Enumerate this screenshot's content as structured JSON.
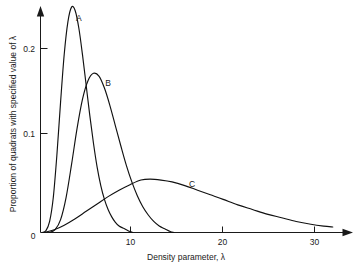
{
  "chart_data": {
    "type": "line",
    "title": "",
    "subtitle": "",
    "xlabel": "Density parameter, λ",
    "ylabel": "Proportion of quadrats with specified value of λ",
    "xlim": [
      0,
      34
    ],
    "ylim": [
      0,
      0.255
    ],
    "grid": false,
    "legend_position": "inline-curve-labels",
    "xticks": [
      {
        "value": 0,
        "label": "0"
      },
      {
        "value": 10,
        "label": "10"
      },
      {
        "value": 20,
        "label": "20"
      },
      {
        "value": 30,
        "label": "30"
      }
    ],
    "yticks": [
      {
        "value": 0,
        "label": "0"
      },
      {
        "value": 0.1,
        "label": "0.1"
      },
      {
        "value": 0.2,
        "label": "0.2"
      }
    ],
    "annotations": [
      {
        "text": "A",
        "x": 4.2,
        "y": 0.233
      },
      {
        "text": "B",
        "x": 7.4,
        "y": 0.163
      },
      {
        "text": "C",
        "x": 16.6,
        "y": 0.053
      }
    ],
    "series": [
      {
        "name": "A",
        "label": "A",
        "color": "#111111",
        "peak_x": 3.4,
        "peak_y": 0.245,
        "x": [
          0.2,
          0.6,
          1.0,
          1.4,
          1.8,
          2.2,
          2.6,
          3.0,
          3.4,
          3.8,
          4.2,
          4.6,
          5.0,
          5.4,
          5.8,
          6.2,
          6.6,
          7.0,
          7.4,
          7.8,
          8.2,
          8.6,
          9.0,
          9.4,
          9.8,
          10.1
        ],
        "y": [
          0.0,
          0.002,
          0.012,
          0.038,
          0.085,
          0.142,
          0.194,
          0.229,
          0.245,
          0.241,
          0.222,
          0.193,
          0.16,
          0.127,
          0.097,
          0.071,
          0.051,
          0.036,
          0.025,
          0.017,
          0.011,
          0.007,
          0.005,
          0.003,
          0.001,
          0.0
        ]
      },
      {
        "name": "B",
        "label": "B",
        "color": "#111111",
        "peak_x": 6.1,
        "peak_y": 0.173,
        "x": [
          1.0,
          1.6,
          2.2,
          2.8,
          3.4,
          4.0,
          4.6,
          5.2,
          5.8,
          6.4,
          7.0,
          7.6,
          8.2,
          8.8,
          9.4,
          10.0,
          10.6,
          11.2,
          11.8,
          12.4,
          13.0,
          13.6,
          14.2,
          14.6
        ],
        "y": [
          0.0,
          0.003,
          0.014,
          0.038,
          0.074,
          0.113,
          0.145,
          0.165,
          0.173,
          0.17,
          0.157,
          0.138,
          0.116,
          0.094,
          0.073,
          0.055,
          0.04,
          0.028,
          0.019,
          0.012,
          0.007,
          0.004,
          0.001,
          0.0
        ]
      },
      {
        "name": "C",
        "label": "C",
        "color": "#111111",
        "peak_x": 12.0,
        "peak_y": 0.058,
        "x": [
          0.4,
          1.5,
          2.6,
          3.8,
          5.0,
          6.2,
          7.4,
          8.6,
          9.8,
          11.0,
          12.0,
          13.2,
          14.4,
          15.8,
          17.2,
          18.6,
          20.0,
          21.6,
          23.2,
          24.8,
          26.4,
          28.0,
          29.6,
          31.0,
          32.0
        ],
        "y": [
          0.0,
          0.003,
          0.008,
          0.015,
          0.023,
          0.031,
          0.039,
          0.046,
          0.052,
          0.057,
          0.058,
          0.057,
          0.055,
          0.051,
          0.046,
          0.041,
          0.036,
          0.03,
          0.025,
          0.02,
          0.016,
          0.012,
          0.009,
          0.007,
          0.006
        ]
      }
    ]
  }
}
